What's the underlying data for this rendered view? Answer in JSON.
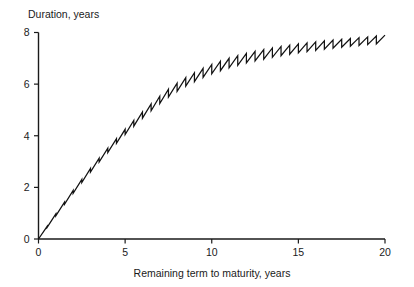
{
  "chart_data": {
    "type": "line",
    "title": "",
    "subtitle": "",
    "ylabel": "Duration, years",
    "xlabel": "Remaining term to maturity, years",
    "xlim": [
      0,
      20
    ],
    "ylim": [
      0,
      8
    ],
    "xticks": [
      0,
      5,
      10,
      15,
      20
    ],
    "xtick_labels": [
      "0",
      "5",
      "10",
      "15",
      "20"
    ],
    "yticks": [
      0,
      2,
      4,
      6,
      8
    ],
    "ytick_labels": [
      "0",
      "2",
      "4",
      "6",
      "8"
    ],
    "grid": false,
    "legend": null,
    "legend_position": "none",
    "annotations": [],
    "series": [
      {
        "name": "Duration",
        "note": "Sawtooth duration profile: duration rises between coupon dates then drops at each semi-annual coupon payment; overall concave increase from 0 to about 7.9 years.",
        "coupon_period_years": 0.5,
        "envelope_x": [
          0,
          0.5,
          1,
          1.5,
          2,
          2.5,
          3,
          3.5,
          4,
          4.5,
          5,
          5.5,
          6,
          6.5,
          7,
          7.5,
          8,
          8.5,
          9,
          9.5,
          10,
          10.5,
          11,
          11.5,
          12,
          12.5,
          13,
          13.5,
          14,
          14.5,
          15,
          15.5,
          16,
          16.5,
          17,
          17.5,
          18,
          18.5,
          19,
          19.5,
          20
        ],
        "envelope_upper": [
          0.0,
          0.49,
          0.97,
          1.43,
          1.88,
          2.31,
          2.73,
          3.13,
          3.52,
          3.89,
          4.25,
          4.59,
          4.92,
          5.23,
          5.53,
          5.8,
          6.04,
          6.25,
          6.44,
          6.61,
          6.76,
          6.89,
          7.0,
          7.1,
          7.19,
          7.27,
          7.34,
          7.4,
          7.46,
          7.51,
          7.56,
          7.6,
          7.64,
          7.68,
          7.71,
          7.74,
          7.77,
          7.8,
          7.83,
          7.86,
          7.9
        ],
        "envelope_lower": [
          0.0,
          0.45,
          0.9,
          1.34,
          1.77,
          2.19,
          2.59,
          2.98,
          3.35,
          3.71,
          4.05,
          4.37,
          4.68,
          4.97,
          5.25,
          5.5,
          5.72,
          5.92,
          6.1,
          6.26,
          6.4,
          6.52,
          6.63,
          6.73,
          6.82,
          6.9,
          6.97,
          7.04,
          7.1,
          7.16,
          7.21,
          7.26,
          7.31,
          7.35,
          7.39,
          7.43,
          7.47,
          7.5,
          7.53,
          7.56,
          7.6
        ]
      }
    ]
  }
}
